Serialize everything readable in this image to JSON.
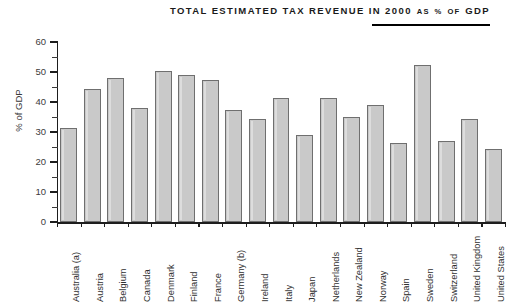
{
  "title": {
    "line_main": "Total Estimated Tax Revenue in 2000",
    "part1": "Total Estimated Tax Revenue in 2000",
    "part2": "as",
    "part3": "%",
    "part4": "of",
    "part5": "GDP",
    "full": "TOTAL ESTIMATED TAX REVENUE IN 2000 AS % OF GDP"
  },
  "axes": {
    "y_title": "% of GDP",
    "y_ticks": [
      "0",
      "10",
      "20",
      "30",
      "40",
      "50",
      "60"
    ]
  },
  "colors": {
    "bar_fill": "#c9c9c9",
    "bar_border": "#6f6f6f",
    "axis": "#1d1d1d",
    "text": "#2f2f2f",
    "title_rule": "#000000"
  },
  "chart_data": {
    "type": "bar",
    "xlabel": "",
    "ylabel": "% of GDP",
    "ylim": [
      0,
      60
    ],
    "ytick_step": 10,
    "yminor_step": 5,
    "grid": false,
    "legend": false,
    "categories": [
      "Australia (a)",
      "Austria",
      "Belgium",
      "Canada",
      "Denmark",
      "Finland",
      "France",
      "Germany (b)",
      "Ireland",
      "Italy",
      "Japan",
      "Netherlands",
      "New Zealand",
      "Norway",
      "Spain",
      "Sweden",
      "Switzerland",
      "United Kingdom",
      "United States"
    ],
    "values": [
      31.5,
      44.2,
      48.0,
      37.9,
      50.3,
      49.0,
      47.5,
      37.3,
      34.5,
      41.3,
      28.9,
      41.2,
      35.0,
      39.0,
      26.5,
      52.3,
      27.0,
      34.5,
      24.5
    ]
  }
}
